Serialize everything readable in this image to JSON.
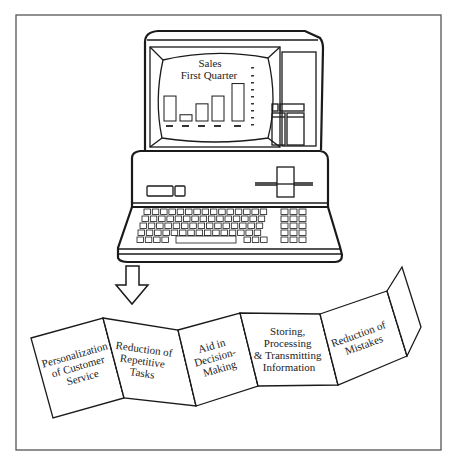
{
  "figure": {
    "frame_color": "#555555",
    "line_color": "#1a1a1a",
    "background": "#ffffff"
  },
  "monitor": {
    "screen_title_line1": "Sales",
    "screen_title_line2": "First Quarter"
  },
  "chart_data": {
    "type": "bar",
    "title": "Sales First Quarter",
    "categories": [
      "1",
      "2",
      "3",
      "4",
      "5"
    ],
    "values": [
      48,
      12,
      33,
      48,
      72
    ],
    "xlabel": "",
    "ylabel": "",
    "ylim": [
      0,
      100
    ],
    "note": "Bar chart drawn on computer monitor; tick labels illegible, values estimated as relative heights"
  },
  "arrow": {
    "icon": "down-arrow-icon"
  },
  "panels": [
    {
      "id": "panel-1",
      "lines": [
        "Personalization",
        "of Customer",
        "Service"
      ]
    },
    {
      "id": "panel-2",
      "lines": [
        "Reduction of",
        "Repetitive",
        "Tasks"
      ]
    },
    {
      "id": "panel-3",
      "lines": [
        "Aid in",
        "Decision-",
        "Making"
      ]
    },
    {
      "id": "panel-4",
      "lines": [
        "Storing,",
        "Processing",
        "& Transmitting",
        "Information"
      ]
    },
    {
      "id": "panel-5",
      "lines": [
        "Reduction of",
        "Mistakes"
      ]
    }
  ]
}
